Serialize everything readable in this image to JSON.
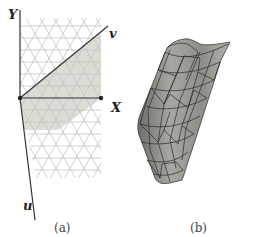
{
  "figure": {
    "panels": [
      {
        "id": "a",
        "caption": "(a)",
        "description": "Planar triangular lattice with X/Y axes and lattice vectors u, v; shaded fundamental region",
        "axes": {
          "x_label": "X",
          "y_label": "Y",
          "u_label": "u",
          "v_label": "v"
        }
      },
      {
        "id": "b",
        "caption": "(b)",
        "description": "Rolled-up triangulated surface (cylinder-like sheet) formed from the lattice"
      }
    ],
    "colors": {
      "grid_line": "#c8c8c8",
      "shade": "#dcdcd4",
      "axis": "#333333",
      "surface_fill": "#9a9a94",
      "surface_edge": "#2a2a2a"
    }
  }
}
